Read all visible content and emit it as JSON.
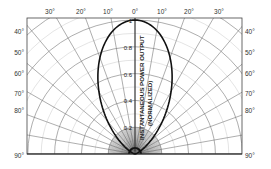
{
  "chart_data": {
    "type": "line",
    "subtype": "polar-half",
    "title": "",
    "radial_axis_label_line1": "INSTANTANEOUS POWER OUTPUT",
    "radial_axis_label_line2": "(NORMALIZED)",
    "angle_ticks_top": [
      "30°",
      "20°",
      "10°",
      "0°",
      "10°",
      "20°",
      "30°"
    ],
    "angle_ticks_side": [
      "40°",
      "50°",
      "60°",
      "70°",
      "80°",
      "90°"
    ],
    "radial_ticks": [
      "0.2",
      "0.4",
      "0.6",
      "0.8",
      "1"
    ],
    "radial_range": [
      0,
      1
    ],
    "angle_range_deg": [
      -90,
      90
    ],
    "grid": true,
    "series": [
      {
        "name": "Normalized power pattern",
        "theta_deg": [
          -90,
          -80,
          -70,
          -60,
          -50,
          -40,
          -30,
          -25,
          -20,
          -15,
          -10,
          -5,
          0,
          5,
          10,
          15,
          20,
          25,
          30,
          40,
          50,
          60,
          70,
          80,
          90
        ],
        "r": [
          0.0,
          0.0,
          0.01,
          0.05,
          0.15,
          0.32,
          0.54,
          0.66,
          0.77,
          0.86,
          0.94,
          0.98,
          1.0,
          0.98,
          0.94,
          0.86,
          0.77,
          0.66,
          0.54,
          0.32,
          0.15,
          0.05,
          0.01,
          0.0,
          0.0
        ]
      }
    ]
  },
  "labels": {
    "top": [
      "30°",
      "20°",
      "10°",
      "0°",
      "10°",
      "20°",
      "30°"
    ],
    "left": [
      "40°",
      "50°",
      "60°",
      "70°",
      "80°",
      "90°"
    ],
    "right": [
      "40°",
      "50°",
      "60°",
      "70°",
      "80°",
      "90°"
    ],
    "radial": [
      "0.2",
      "0.4",
      "0.6",
      "0.8",
      "1"
    ],
    "axis_line1": "INSTANTANEOUS POWER OUTPUT",
    "axis_line2": "(NORMALIZED)"
  }
}
